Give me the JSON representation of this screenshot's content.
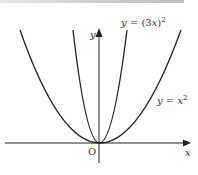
{
  "figure": {
    "curves": [
      {
        "name": "narrow-parabola",
        "label_lhs": "y",
        "label_eq": " = (3",
        "label_var": "x",
        "label_rhs": ")",
        "label_exp": "2"
      },
      {
        "name": "wide-parabola",
        "label_lhs": "y",
        "label_eq": " = ",
        "label_var": "x",
        "label_exp": "2"
      }
    ],
    "axes": {
      "x_label": "x",
      "y_label": "y",
      "origin_label": "O"
    },
    "colors": {
      "curve": "#222222",
      "axis": "#222222"
    }
  }
}
